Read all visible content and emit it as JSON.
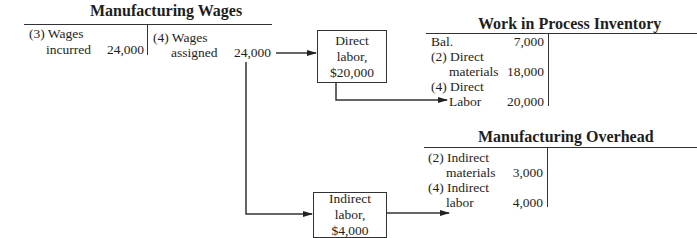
{
  "manufacturing_wages": {
    "title": "Manufacturing Wages",
    "debit": {
      "line1": "(3) Wages",
      "line2": "incurred",
      "amount": "24,000"
    },
    "credit": {
      "line1": "(4) Wages",
      "line2": "assigned",
      "amount": "24,000"
    }
  },
  "direct_labor_box": {
    "line1": "Direct",
    "line2": "labor,",
    "line3": "$20,000"
  },
  "indirect_labor_box": {
    "line1": "Indirect",
    "line2": "labor,",
    "line3": "$4,000"
  },
  "work_in_process": {
    "title": "Work in Process Inventory",
    "entries": [
      {
        "label": "Bal.",
        "amount": "7,000"
      },
      {
        "label": "(2) Direct",
        "amount": ""
      },
      {
        "label": "materials",
        "amount": "18,000"
      },
      {
        "label": "(4) Direct",
        "amount": ""
      },
      {
        "label": "Labor",
        "amount": "20,000"
      }
    ]
  },
  "manufacturing_overhead": {
    "title": "Manufacturing Overhead",
    "entries": [
      {
        "label": "(2) Indirect",
        "amount": ""
      },
      {
        "label": "materials",
        "amount": "3,000"
      },
      {
        "label": "(4) Indirect",
        "amount": ""
      },
      {
        "label": "labor",
        "amount": "4,000"
      }
    ]
  }
}
